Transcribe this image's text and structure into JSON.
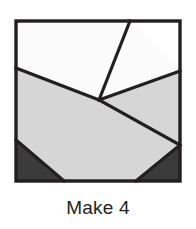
{
  "figure": {
    "name": "quilt-block-diagram",
    "caption": "Make 4",
    "frame": {
      "stroke_color": "#231f20",
      "stroke_width": 3.2,
      "x": 2,
      "y": 2,
      "width": 164,
      "height": 160
    },
    "palette": {
      "background": "#ffffff",
      "white": "#fbfbfb",
      "light_gray": "#d6d6d6",
      "dark_gray": "#3b3b3b",
      "line": "#231f20",
      "text": "#231f20"
    },
    "pieces": [
      {
        "name": "top-left-white-piece",
        "fill": "#fbfbfb",
        "points": "2,2 116,2 85,81 2,49"
      },
      {
        "name": "upper-right-white-wedge",
        "fill": "#fbfbfb",
        "points": "116,2 166,52 85,81"
      },
      {
        "name": "left-light-gray-piece",
        "fill": "#d6d6d6",
        "points": "2,49 85,81 166,126 122,162 50,162 2,121"
      },
      {
        "name": "right-light-gray-piece",
        "fill": "#d6d6d6",
        "points": "85,81 166,52 166,126"
      },
      {
        "name": "bottom-left-dark-triangle",
        "fill": "#3b3b3b",
        "points": "2,121 50,162 2,162"
      },
      {
        "name": "bottom-right-dark-triangle",
        "fill": "#3b3b3b",
        "points": "166,126 166,162 122,162"
      }
    ],
    "seam_lines": [
      {
        "name": "seam-left-to-center",
        "x1": 2,
        "y1": 49,
        "x2": 85,
        "y2": 81
      },
      {
        "name": "seam-center-to-top",
        "x1": 85,
        "y1": 81,
        "x2": 116,
        "y2": 2
      },
      {
        "name": "seam-center-to-right",
        "x1": 85,
        "y1": 81,
        "x2": 166,
        "y2": 52
      },
      {
        "name": "seam-center-to-lower-right",
        "x1": 85,
        "y1": 81,
        "x2": 166,
        "y2": 126
      },
      {
        "name": "seam-bottom-left-diagonal",
        "x1": 2,
        "y1": 121,
        "x2": 50,
        "y2": 162
      },
      {
        "name": "seam-bottom-right-diagonal",
        "x1": 166,
        "y1": 126,
        "x2": 122,
        "y2": 162
      }
    ]
  }
}
